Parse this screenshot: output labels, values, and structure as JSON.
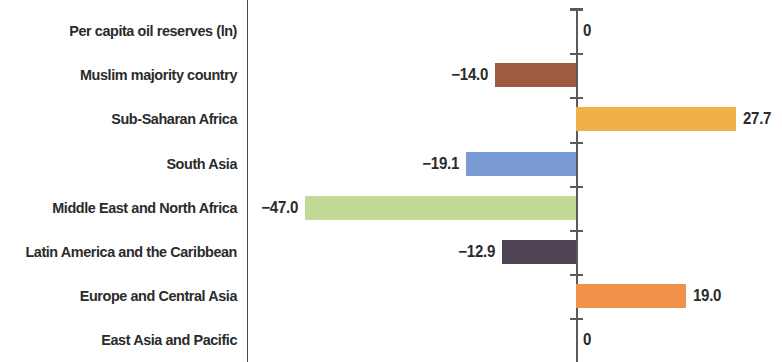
{
  "chart_data": {
    "type": "bar",
    "orientation": "horizontal",
    "title": "",
    "subtitle": "",
    "xlabel": "",
    "ylabel": "",
    "grid": false,
    "legend": "none",
    "zero_axis": true,
    "xlim": [
      -50,
      32
    ],
    "categories": [
      "Per capita oil  reserves (ln)",
      "Muslim majority country",
      "Sub-Saharan Africa",
      "South Asia",
      "Middle East and North Africa",
      "Latin America and the Caribbean",
      "Europe and Central Asia",
      "East Asia and Pacific"
    ],
    "values": [
      0,
      -14.0,
      27.7,
      -19.1,
      -47.0,
      -12.9,
      19.0,
      0
    ],
    "value_labels": [
      "0",
      "−14.0",
      "27.7",
      "−19.1",
      "−47.0",
      "−12.9",
      "19.0",
      "0"
    ],
    "colors": [
      "none",
      "#9E5B41",
      "#F0B04A",
      "#7B9BD4",
      "#C3DA97",
      "#4E4352",
      "#F2914A",
      "none"
    ],
    "bars": [
      {
        "category": "Per capita oil  reserves (ln)",
        "value": 0,
        "label": "0",
        "color": "none"
      },
      {
        "category": "Muslim majority country",
        "value": -14.0,
        "label": "−14.0",
        "color": "#9E5B41"
      },
      {
        "category": "Sub-Saharan Africa",
        "value": 27.7,
        "label": "27.7",
        "color": "#F0B04A"
      },
      {
        "category": "South Asia",
        "value": -19.1,
        "label": "−19.1",
        "color": "#7B9BD4"
      },
      {
        "category": "Middle East and North Africa",
        "value": -47.0,
        "label": "−47.0",
        "color": "#C3DA97"
      },
      {
        "category": "Latin America and the Caribbean",
        "value": -12.9,
        "label": "−12.9",
        "color": "#4E4352"
      },
      {
        "category": "Europe and Central Asia",
        "value": 19.0,
        "label": "19.0",
        "color": "#F2914A"
      },
      {
        "category": "East Asia and Pacific",
        "value": 0,
        "label": "0",
        "color": "none"
      }
    ]
  },
  "style": {
    "axis_color": "#5b5b5b",
    "divider_color": "#4a4a4a",
    "text_color": "#2b2b2b",
    "background": "#ffffff"
  }
}
